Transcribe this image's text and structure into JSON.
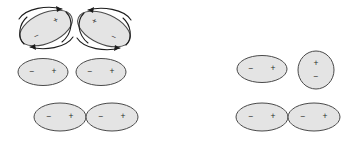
{
  "figure": {
    "background_color": "#ffffff",
    "width": 349,
    "height": 143,
    "dipole_fill_color": "#e4e4e4",
    "dipole_stroke_color": "#4a4a4a",
    "arrow_color": "#1c1c1c",
    "charge_text_color": "#2b2b2b"
  },
  "charges": {
    "positive": "+",
    "negative": "−"
  },
  "groups": [
    {
      "id": "top-left-group",
      "name": "rotating-dipole-pair",
      "row": "top",
      "side": "left",
      "has_rotation_arrows": true,
      "dipoles": [
        {
          "id": "dipole-1",
          "name": "tilted-dipole-ccw",
          "cx": 46,
          "cy": 28,
          "rx": 28,
          "ry": 15,
          "rotation_deg": -24,
          "positive_label": "+",
          "negative_label": "−",
          "positive_pos": {
            "x": 12,
            "y": -3
          },
          "negative_pos": {
            "x": -12,
            "y": 4
          },
          "arrows": [
            {
              "id": "arc-top-1",
              "name": "rotation-arrow-top",
              "direction": "right"
            },
            {
              "id": "arc-bottom-1",
              "name": "rotation-arrow-bottom",
              "direction": "left"
            }
          ]
        },
        {
          "id": "dipole-2",
          "name": "tilted-dipole-cw",
          "cx": 104,
          "cy": 29,
          "rx": 28,
          "ry": 15,
          "rotation_deg": 24,
          "positive_label": "+",
          "negative_label": "−",
          "positive_pos": {
            "x": -12,
            "y": -3
          },
          "negative_pos": {
            "x": 12,
            "y": 4
          },
          "arrows": [
            {
              "id": "arc-top-2",
              "name": "rotation-arrow-top",
              "direction": "left"
            },
            {
              "id": "arc-bottom-2",
              "name": "rotation-arrow-bottom",
              "direction": "right"
            }
          ]
        }
      ]
    },
    {
      "id": "middle-left-group",
      "name": "separated-aligned-dipole-pair",
      "row": "middle",
      "side": "left",
      "has_rotation_arrows": false,
      "dipoles": [
        {
          "id": "dipole-3",
          "name": "horizontal-dipole",
          "cx": 43,
          "cy": 72,
          "rx": 25,
          "ry": 13.5,
          "rotation_deg": 0,
          "positive_label": "+",
          "negative_label": "−",
          "positive_pos": {
            "x": 11,
            "y": 0
          },
          "negative_pos": {
            "x": -11,
            "y": 0
          },
          "arrows": []
        },
        {
          "id": "dipole-4",
          "name": "horizontal-dipole",
          "cx": 101,
          "cy": 72,
          "rx": 25,
          "ry": 13.5,
          "rotation_deg": 0,
          "positive_label": "+",
          "negative_label": "−",
          "positive_pos": {
            "x": 11,
            "y": 0
          },
          "negative_pos": {
            "x": -11,
            "y": 0
          },
          "arrows": []
        }
      ]
    },
    {
      "id": "bottom-left-group",
      "name": "touching-aligned-dipole-pair",
      "row": "bottom",
      "side": "left",
      "has_rotation_arrows": false,
      "dipoles": [
        {
          "id": "dipole-5",
          "name": "horizontal-dipole",
          "cx": 60,
          "cy": 117,
          "rx": 26,
          "ry": 14,
          "rotation_deg": 0,
          "positive_label": "+",
          "negative_label": "−",
          "positive_pos": {
            "x": 11,
            "y": 0
          },
          "negative_pos": {
            "x": -11,
            "y": 0
          },
          "arrows": []
        },
        {
          "id": "dipole-6",
          "name": "horizontal-dipole",
          "cx": 112,
          "cy": 117,
          "rx": 26,
          "ry": 14,
          "rotation_deg": 0,
          "positive_label": "+",
          "negative_label": "−",
          "positive_pos": {
            "x": 11,
            "y": 0
          },
          "negative_pos": {
            "x": -11,
            "y": 0
          },
          "arrows": []
        }
      ]
    },
    {
      "id": "middle-right-group",
      "name": "perpendicular-dipole-pair",
      "row": "middle",
      "side": "right",
      "has_rotation_arrows": false,
      "dipoles": [
        {
          "id": "dipole-7",
          "name": "horizontal-dipole",
          "cx": 262,
          "cy": 69,
          "rx": 25,
          "ry": 13.5,
          "rotation_deg": 0,
          "positive_label": "+",
          "negative_label": "−",
          "positive_pos": {
            "x": 11,
            "y": 0
          },
          "negative_pos": {
            "x": -11,
            "y": 0
          },
          "arrows": []
        },
        {
          "id": "dipole-8",
          "name": "vertical-dipole-end-on",
          "cx": 316,
          "cy": 70,
          "rx": 18,
          "ry": 19,
          "rotation_deg": 0,
          "positive_label": "+",
          "negative_label": "−",
          "positive_pos": {
            "x": 0,
            "y": -6
          },
          "negative_pos": {
            "x": 0,
            "y": 7
          },
          "arrows": []
        }
      ]
    },
    {
      "id": "bottom-right-group",
      "name": "touching-aligned-dipole-pair",
      "row": "bottom",
      "side": "right",
      "has_rotation_arrows": false,
      "dipoles": [
        {
          "id": "dipole-9",
          "name": "horizontal-dipole",
          "cx": 262,
          "cy": 117,
          "rx": 26,
          "ry": 14,
          "rotation_deg": 0,
          "positive_label": "+",
          "negative_label": "−",
          "positive_pos": {
            "x": 11,
            "y": 0
          },
          "negative_pos": {
            "x": -11,
            "y": 0
          },
          "arrows": []
        },
        {
          "id": "dipole-10",
          "name": "horizontal-dipole",
          "cx": 314,
          "cy": 117,
          "rx": 26,
          "ry": 14,
          "rotation_deg": 0,
          "positive_label": "+",
          "negative_label": "−",
          "positive_pos": {
            "x": 11,
            "y": 0
          },
          "negative_pos": {
            "x": -11,
            "y": 0
          },
          "arrows": []
        }
      ]
    }
  ]
}
